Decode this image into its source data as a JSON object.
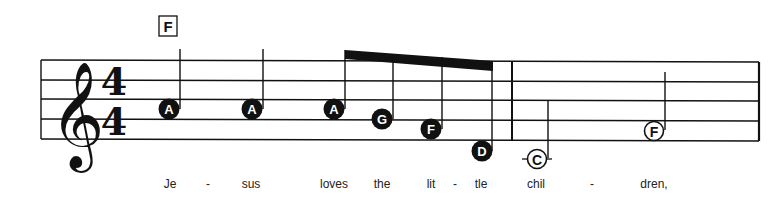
{
  "chord_symbol": {
    "label": "F",
    "x": 168
  },
  "time_signature": {
    "numerator": "4",
    "denominator": "4"
  },
  "clef": "treble",
  "measures": [
    {
      "notes": [
        {
          "name": "A",
          "duration": "quarter",
          "filled": true
        },
        {
          "name": "A",
          "duration": "quarter",
          "filled": true
        },
        {
          "name": "A",
          "duration": "eighth",
          "filled": true
        },
        {
          "name": "G",
          "duration": "eighth",
          "filled": true
        },
        {
          "name": "F",
          "duration": "eighth",
          "filled": true
        },
        {
          "name": "D",
          "duration": "eighth",
          "filled": true
        }
      ]
    },
    {
      "notes": [
        {
          "name": "C",
          "duration": "half",
          "filled": false
        },
        {
          "name": "F",
          "duration": "half",
          "filled": false
        }
      ]
    }
  ],
  "lyrics": [
    {
      "text": "Je",
      "x": 170
    },
    {
      "text": "-",
      "x": 208
    },
    {
      "text": "sus",
      "x": 251
    },
    {
      "text": "loves",
      "x": 334
    },
    {
      "text": "the",
      "x": 382
    },
    {
      "text": "lit",
      "x": 431
    },
    {
      "text": "-",
      "x": 455
    },
    {
      "text": "tle",
      "x": 481
    },
    {
      "text": "chil",
      "x": 536
    },
    {
      "text": "-",
      "x": 592
    },
    {
      "text": "dren,",
      "x": 654
    }
  ],
  "colors": {
    "ink": "#111111",
    "paper": "#ffffff",
    "note_label_on_filled": "#ffffff"
  }
}
